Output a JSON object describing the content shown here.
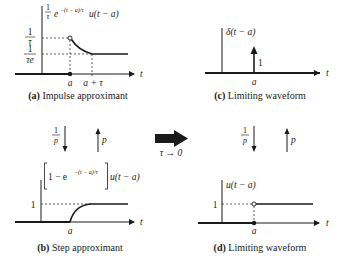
{
  "panels": {
    "a": {
      "caption_tag": "(a)",
      "caption_text": " Impulse approximant",
      "function_label": "e",
      "function_exp": "−(t − a)/τ",
      "function_tail": "u(t − a)",
      "frac_num": "1",
      "frac_den": "τ",
      "ytick_top_num": "1",
      "ytick_top_den": "τ",
      "ytick_low_num": "1",
      "ytick_low_den": "τe",
      "xtick_a": "a",
      "xtick_atau": "a + τ",
      "axis_t": "t"
    },
    "b": {
      "caption_tag": "(b)",
      "caption_text": " Step approximant",
      "function_label_inner": "1 − e",
      "function_exp": "−(t − a)/τ",
      "function_tail": "u(t − a)",
      "ytick_one": "1",
      "xtick_a": "a",
      "axis_t": "t"
    },
    "c": {
      "caption_tag": "(c)",
      "caption_text": " Limiting waveform",
      "function_label": "δ(t − a)",
      "impulse_area": "1",
      "xtick_a": "a",
      "axis_t": "t"
    },
    "d": {
      "caption_tag": "(d)",
      "caption_text": " Limiting waveform",
      "function_label": "u(t − a)",
      "ytick_one": "1",
      "xtick_a": "a",
      "axis_t": "t"
    }
  },
  "operators": {
    "left": {
      "integrate_num": "1",
      "integrate_den": "p",
      "differentiate": "p"
    },
    "right": {
      "integrate_num": "1",
      "integrate_den": "p",
      "differentiate": "p"
    },
    "limit_label": "τ → 0"
  },
  "colors": {
    "ink": "#1a1a1a",
    "background": "#ffffff"
  }
}
